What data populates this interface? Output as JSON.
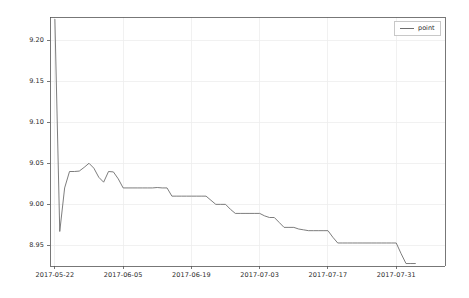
{
  "figure": {
    "width": 469,
    "height": 298,
    "background_color": "#ffffff"
  },
  "legend": {
    "position": "upper-right",
    "entries": [
      {
        "label": "point",
        "color": "#6e6e6e",
        "marker": "line"
      }
    ]
  },
  "axes": {
    "frame_color": "#555555",
    "grid_color": "#ededed",
    "tick_color": "#2b2b2b",
    "plot_left": 50,
    "plot_right": 445,
    "plot_top": 17,
    "plot_bottom": 266
  },
  "chart_data": {
    "type": "line",
    "title": "",
    "xlabel": "",
    "ylabel": "",
    "grid": true,
    "legend_position": "upper right",
    "line_color": "#6e6e6e",
    "x_tick_labels": [
      "2017-05-22",
      "2017-06-05",
      "2017-06-19",
      "2017-07-03",
      "2017-07-17",
      "2017-07-31"
    ],
    "x_tick_values": [
      "2017-05-22",
      "2017-06-05",
      "2017-06-19",
      "2017-07-03",
      "2017-07-17",
      "2017-07-31"
    ],
    "y_tick_labels": [
      "8.95",
      "9.00",
      "9.05",
      "9.10",
      "9.15",
      "9.20"
    ],
    "y_tick_values": [
      8.95,
      9.0,
      9.05,
      9.1,
      9.15,
      9.2
    ],
    "xlim": [
      "2017-05-21",
      "2017-08-10"
    ],
    "ylim": [
      8.925,
      9.228
    ],
    "series": [
      {
        "name": "point",
        "color": "#6e6e6e",
        "x": [
          "2017-05-22",
          "2017-05-23",
          "2017-05-24",
          "2017-05-25",
          "2017-05-26",
          "2017-05-27",
          "2017-05-28",
          "2017-05-29",
          "2017-05-30",
          "2017-05-31",
          "2017-06-01",
          "2017-06-02",
          "2017-06-03",
          "2017-06-04",
          "2017-06-05",
          "2017-06-06",
          "2017-06-07",
          "2017-06-08",
          "2017-06-09",
          "2017-06-10",
          "2017-06-11",
          "2017-06-12",
          "2017-06-13",
          "2017-06-14",
          "2017-06-15",
          "2017-06-16",
          "2017-06-17",
          "2017-06-18",
          "2017-06-19",
          "2017-06-20",
          "2017-06-21",
          "2017-06-22",
          "2017-06-23",
          "2017-06-24",
          "2017-06-25",
          "2017-06-26",
          "2017-06-27",
          "2017-06-28",
          "2017-06-29",
          "2017-06-30",
          "2017-07-01",
          "2017-07-02",
          "2017-07-03",
          "2017-07-04",
          "2017-07-05",
          "2017-07-06",
          "2017-07-07",
          "2017-07-08",
          "2017-07-09",
          "2017-07-10",
          "2017-07-11",
          "2017-07-12",
          "2017-07-13",
          "2017-07-14",
          "2017-07-15",
          "2017-07-16",
          "2017-07-17",
          "2017-07-18",
          "2017-07-19",
          "2017-07-20",
          "2017-07-21",
          "2017-07-22",
          "2017-07-23",
          "2017-07-24",
          "2017-07-25",
          "2017-07-26",
          "2017-07-27",
          "2017-07-28",
          "2017-07-29",
          "2017-07-30",
          "2017-07-31",
          "2017-08-01",
          "2017-08-02",
          "2017-08-03",
          "2017-08-04"
        ],
        "y": [
          9.2255,
          8.967,
          9.02,
          9.04,
          9.04,
          9.0405,
          9.045,
          9.05,
          9.044,
          9.033,
          9.027,
          9.04,
          9.0395,
          9.031,
          9.02,
          9.02,
          9.02,
          9.02,
          9.02,
          9.02,
          9.02,
          9.0205,
          9.02,
          9.02,
          9.01,
          9.01,
          9.01,
          9.01,
          9.01,
          9.01,
          9.01,
          9.01,
          9.005,
          9.0,
          9.0,
          9.0,
          8.994,
          8.989,
          8.989,
          8.989,
          8.989,
          8.989,
          8.989,
          8.986,
          8.984,
          8.984,
          8.978,
          8.972,
          8.972,
          8.972,
          8.97,
          8.969,
          8.968,
          8.968,
          8.968,
          8.968,
          8.968,
          8.96,
          8.953,
          8.953,
          8.953,
          8.953,
          8.953,
          8.953,
          8.953,
          8.953,
          8.953,
          8.953,
          8.953,
          8.953,
          8.953,
          8.94,
          8.928,
          8.928,
          8.928
        ]
      }
    ]
  }
}
